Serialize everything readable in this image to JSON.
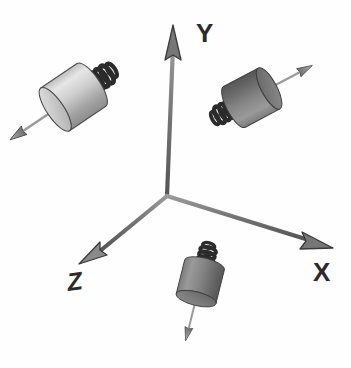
{
  "figure": {
    "background_color": "#fefefe",
    "width": 351,
    "height": 368
  },
  "axes": {
    "origin": {
      "x": 167,
      "y": 196
    },
    "color": "#6b6b6b",
    "outline_color": "#3a3a3a",
    "items": [
      {
        "id": "y",
        "label": "Y",
        "label_x": 196,
        "label_y": 42,
        "tip": {
          "x": 173,
          "y": 27
        },
        "arrow_color": "#7a7a7a"
      },
      {
        "id": "x",
        "label": "X",
        "label_x": 313,
        "label_y": 281,
        "tip": {
          "x": 330,
          "y": 237
        },
        "arrow_color": "#7a7a7a"
      },
      {
        "id": "z",
        "label": "Z",
        "label_x": 76,
        "label_y": 288,
        "tip": {
          "x": 83,
          "y": 253
        },
        "arrow_color": "#7a7a7a"
      }
    ]
  },
  "sensors": [
    {
      "id": "sensor-z",
      "name": "z-axis-sensor",
      "position_label": "upper-left",
      "body_color_light": "#d8d8d8",
      "body_color_dark": "#8a8a8a",
      "cap_color": "#c9c9c9",
      "spring_color": "#2e2e2e",
      "arrow_color": "#8c8c8c",
      "arrow_direction": "up-left",
      "cylinder_center": {
        "x": 72,
        "y": 98
      },
      "rotation_deg": -34
    },
    {
      "id": "sensor-y",
      "name": "y-axis-sensor",
      "position_label": "upper-right",
      "body_color_light": "#8e8e8e",
      "body_color_dark": "#5d5d5d",
      "cap_color": "#6e6e6e",
      "spring_color": "#2e2e2e",
      "arrow_color": "#8c8c8c",
      "arrow_direction": "up-right",
      "cylinder_center": {
        "x": 253,
        "y": 97
      },
      "rotation_deg": 28
    },
    {
      "id": "sensor-x",
      "name": "x-axis-sensor",
      "position_label": "bottom-center",
      "body_color_light": "#8e8e8e",
      "body_color_dark": "#5d5d5d",
      "cap_color": "#6e6e6e",
      "spring_color": "#2e2e2e",
      "arrow_color": "#8c8c8c",
      "arrow_direction": "down",
      "cylinder_center": {
        "x": 200,
        "y": 283
      },
      "rotation_deg": 104
    }
  ]
}
